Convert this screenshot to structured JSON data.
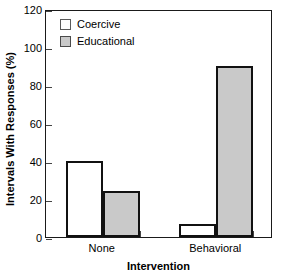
{
  "chart_data": {
    "type": "bar",
    "title": "",
    "xlabel": "Intervention",
    "ylabel": "Intervals With Responses (%)",
    "categories": [
      "None",
      "Behavioral"
    ],
    "series": [
      {
        "name": "Coercive",
        "values": [
          40,
          7
        ],
        "color": "#ffffff"
      },
      {
        "name": "Educational",
        "values": [
          24,
          90
        ],
        "color": "#c9c9c9"
      }
    ],
    "ylim": [
      0,
      120
    ],
    "yticks": [
      0,
      20,
      40,
      60,
      80,
      100,
      120
    ],
    "ytick_labels": [
      "0",
      "20",
      "40",
      "60",
      "80",
      "100",
      "120"
    ],
    "grid": false,
    "legend_position": "upper-left",
    "bar_edge_color": "#111111"
  },
  "legend": {
    "entries": [
      {
        "label": "Coercive"
      },
      {
        "label": "Educational"
      }
    ]
  },
  "axes": {
    "y_title": "Intervals With Responses (%)",
    "x_title": "Intervention"
  }
}
